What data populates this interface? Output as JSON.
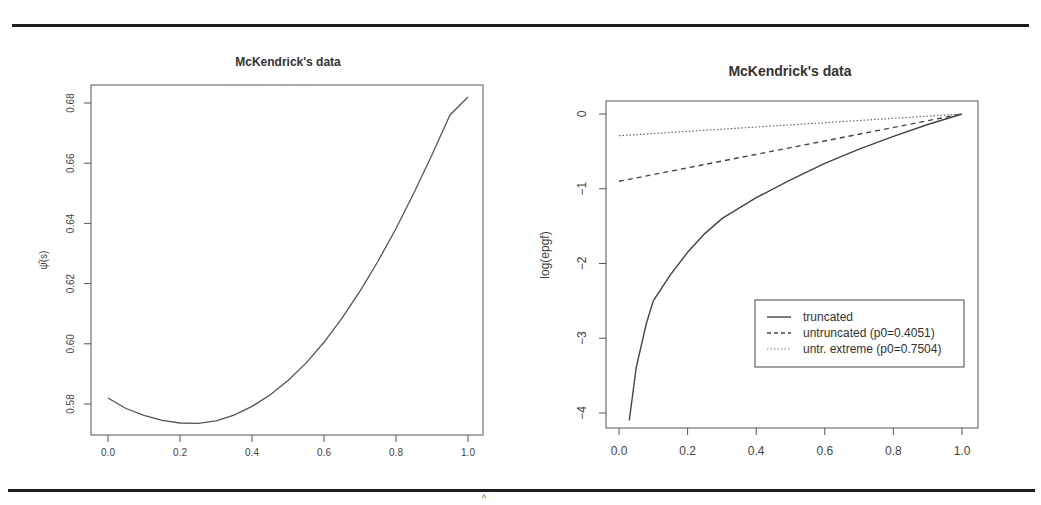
{
  "page": {
    "caret_mark": "^"
  },
  "chart_data": [
    {
      "type": "line",
      "title": "McKendrick's data",
      "xlabel": "",
      "ylabel": "ψ̂(s)",
      "xlim": [
        0.0,
        1.0
      ],
      "ylim": [
        0.57,
        0.685
      ],
      "x_ticks": [
        "0.0",
        "0.2",
        "0.4",
        "0.6",
        "0.8",
        "1.0"
      ],
      "y_ticks": [
        "0.58",
        "0.60",
        "0.62",
        "0.64",
        "0.66",
        "0.68"
      ],
      "grid": false,
      "series": [
        {
          "name": "psi_hat",
          "style": "solid",
          "x": [
            0.0,
            0.05,
            0.1,
            0.15,
            0.2,
            0.25,
            0.3,
            0.35,
            0.4,
            0.45,
            0.5,
            0.55,
            0.6,
            0.65,
            0.7,
            0.75,
            0.8,
            0.85,
            0.9,
            0.95,
            1.0
          ],
          "values": [
            0.582,
            0.5785,
            0.5762,
            0.5746,
            0.5737,
            0.5736,
            0.5744,
            0.5763,
            0.5792,
            0.583,
            0.5878,
            0.5936,
            0.6005,
            0.6085,
            0.6175,
            0.6274,
            0.6383,
            0.6502,
            0.6628,
            0.676,
            0.682
          ]
        }
      ]
    },
    {
      "type": "line",
      "title": "McKendrick's data",
      "xlabel": "",
      "ylabel": "log(epgf)",
      "xlim": [
        0.0,
        1.0
      ],
      "ylim": [
        -4.1,
        0.1
      ],
      "x_ticks": [
        "0.0",
        "0.2",
        "0.4",
        "0.6",
        "0.8",
        "1.0"
      ],
      "y_ticks": [
        "−4",
        "−3",
        "−2",
        "−1",
        "0"
      ],
      "grid": false,
      "legend_position": "bottom-right",
      "series": [
        {
          "name": "truncated",
          "style": "solid",
          "x": [
            0.03,
            0.05,
            0.08,
            0.1,
            0.15,
            0.2,
            0.25,
            0.3,
            0.4,
            0.5,
            0.6,
            0.7,
            0.8,
            0.9,
            1.0
          ],
          "values": [
            -4.1,
            -3.4,
            -2.8,
            -2.5,
            -2.15,
            -1.85,
            -1.6,
            -1.4,
            -1.12,
            -0.88,
            -0.66,
            -0.47,
            -0.3,
            -0.14,
            0.0
          ]
        },
        {
          "name": "untruncated (p0=0.4051)",
          "style": "dashed",
          "x": [
            0.0,
            1.0
          ],
          "values": [
            -0.9,
            0.0
          ]
        },
        {
          "name": "untr. extreme (p0=0.7504)",
          "style": "dotted",
          "x": [
            0.0,
            1.0
          ],
          "values": [
            -0.29,
            0.0
          ]
        }
      ],
      "legend": [
        "truncated",
        "untruncated (p0=0.4051)",
        "untr. extreme (p0=0.7504)"
      ]
    }
  ]
}
